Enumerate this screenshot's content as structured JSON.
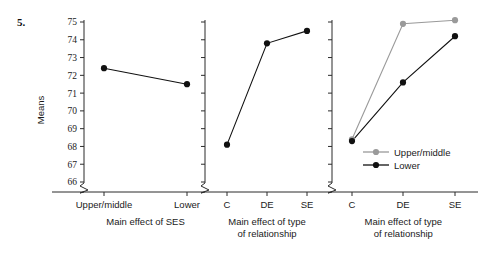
{
  "figure": {
    "number_label": "5.",
    "y_axis_title": "Means"
  },
  "legend": {
    "position": "inside-panel-3-lower-right",
    "entries": [
      {
        "label": "Upper/middle",
        "color": "#9a9a9a"
      },
      {
        "label": "Lower",
        "color": "#111111"
      }
    ]
  },
  "colors": {
    "upper_middle": "#9a9a9a",
    "lower": "#111111",
    "axis": "#2b2b2b"
  },
  "chart_data": {
    "type": "line",
    "title": "",
    "xlabel": "",
    "ylabel": "Means",
    "ylim": [
      66,
      75
    ],
    "y_ticks": [
      66,
      67,
      68,
      69,
      70,
      71,
      72,
      73,
      74,
      75
    ],
    "y_axis_break": true,
    "grid": false,
    "legend": [
      "Upper/middle",
      "Lower"
    ],
    "panels": [
      {
        "name": "panel-main-effect-of-ses",
        "caption": "Main effect of SES",
        "categories": [
          "Upper/middle",
          "Lower"
        ],
        "show_y_tick_labels": true,
        "series": [
          {
            "name": "Means",
            "color": "#111111",
            "values": [
              72.4,
              71.5
            ]
          }
        ]
      },
      {
        "name": "panel-main-effect-of-type-of-relationship",
        "caption": "Main effect of type of relationship",
        "categories": [
          "C",
          "DE",
          "SE"
        ],
        "show_y_tick_labels": false,
        "series": [
          {
            "name": "Means",
            "color": "#111111",
            "values": [
              68.1,
              73.8,
              74.5
            ]
          }
        ]
      },
      {
        "name": "panel-interaction-type-of-relationship-by-ses",
        "caption": "Main effect of type of relationship",
        "categories": [
          "C",
          "DE",
          "SE"
        ],
        "show_y_tick_labels": false,
        "series": [
          {
            "name": "Upper/middle",
            "color": "#9a9a9a",
            "values": [
              68.4,
              74.9,
              75.1
            ]
          },
          {
            "name": "Lower",
            "color": "#111111",
            "values": [
              68.3,
              71.6,
              74.2
            ]
          }
        ]
      }
    ]
  }
}
